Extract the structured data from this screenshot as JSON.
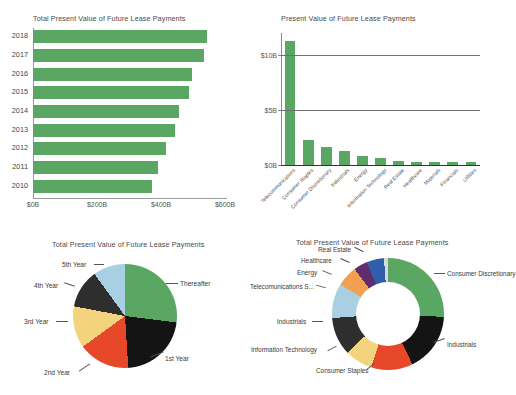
{
  "chart_data": [
    {
      "id": "total-pv-by-year",
      "type": "bar",
      "orientation": "horizontal",
      "title": "Total Present Value of Future Lease Payments",
      "xlabel": "",
      "ylabel": "",
      "categories": [
        "2018",
        "2017",
        "2016",
        "2015",
        "2014",
        "2013",
        "2012",
        "2011",
        "2010"
      ],
      "values": [
        545,
        535,
        497,
        487,
        455,
        445,
        415,
        390,
        372
      ],
      "unit": "$B",
      "xlim": [
        0,
        600
      ],
      "xticks": [
        "$0B",
        "$200B",
        "$400B",
        "$600B"
      ],
      "xtick_values": [
        0,
        200,
        400,
        600
      ],
      "grid": false,
      "series_color": "#5aa763"
    },
    {
      "id": "pv-by-sector",
      "type": "bar",
      "orientation": "vertical",
      "title": "Present Value of Future Lease Payments",
      "xlabel": "",
      "ylabel": "",
      "categories": [
        "Telecommunications",
        "Consumer Staples",
        "Consumer Discretionary",
        "Industrials",
        "Energy",
        "Information Technology",
        "Real Estate",
        "Healthcare",
        "Materials",
        "Financials",
        "Utilities"
      ],
      "values": [
        11.3,
        2.3,
        1.65,
        1.25,
        0.8,
        0.6,
        0.35,
        0.3,
        0.28,
        0.25,
        0.3
      ],
      "unit": "$B",
      "ylim": [
        0,
        12
      ],
      "yticks": [
        "$0B",
        "$5B",
        "$10B"
      ],
      "ytick_values": [
        0,
        5,
        10
      ],
      "grid": true,
      "series_color": "#5aa763"
    },
    {
      "id": "pv-by-maturity",
      "type": "pie",
      "title": "Total Present Value of Future Lease Payments",
      "labels": [
        "Thereafter",
        "1st Year",
        "2nd Year",
        "3rd Year",
        "4th Year",
        "5th Year"
      ],
      "values": [
        27,
        22,
        16,
        13,
        12,
        10
      ],
      "colors": [
        "#5aa763",
        "#141414",
        "#e8482a",
        "#f3d37e",
        "#2e2e2e",
        "#a9cfe3"
      ],
      "legend": "callout-labels"
    },
    {
      "id": "pv-by-sector-share",
      "type": "pie",
      "variant": "donut",
      "title": "Total Present Value of Future Lease Payments",
      "labels": [
        "Consumer Discretionary",
        "Industrials",
        "Consumer Staples",
        "Information Technology",
        "Industrials",
        "Telecomunications S...",
        "Energy",
        "Healthcare",
        "Real Estate"
      ],
      "values": [
        25,
        17,
        12,
        8,
        11,
        10,
        6,
        4,
        5
      ],
      "colors": [
        "#5aa763",
        "#141414",
        "#e8482a",
        "#f3d37e",
        "#2e2e2e",
        "#a9cfe3",
        "#f0a050",
        "#5f2d6e",
        "#2f5fab"
      ],
      "extra_slice_color": "#d8d8d8",
      "legend": "callout-labels"
    }
  ],
  "hbar": {
    "title": "Total Present Value of Future Lease Payments",
    "rows": [
      {
        "cat": "2018",
        "val": 545
      },
      {
        "cat": "2017",
        "val": 535
      },
      {
        "cat": "2016",
        "val": 497
      },
      {
        "cat": "2015",
        "val": 487
      },
      {
        "cat": "2014",
        "val": 455
      },
      {
        "cat": "2013",
        "val": 445
      },
      {
        "cat": "2012",
        "val": 415
      },
      {
        "cat": "2011",
        "val": 390
      },
      {
        "cat": "2010",
        "val": 372
      }
    ],
    "ticks": [
      "$0B",
      "$200B",
      "$400B",
      "$600B"
    ]
  },
  "vbar": {
    "title": "Present Value of Future Lease Payments",
    "bars": [
      {
        "cat": "Telecommunications",
        "val": 11.3
      },
      {
        "cat": "Consumer Staples",
        "val": 2.3
      },
      {
        "cat": "Consumer Discretionary",
        "val": 1.65
      },
      {
        "cat": "Industrials",
        "val": 1.25
      },
      {
        "cat": "Energy",
        "val": 0.8
      },
      {
        "cat": "Information Technology",
        "val": 0.6
      },
      {
        "cat": "Real Estate",
        "val": 0.35
      },
      {
        "cat": "Healthcare",
        "val": 0.3
      },
      {
        "cat": "Materials",
        "val": 0.28
      },
      {
        "cat": "Financials",
        "val": 0.25
      },
      {
        "cat": "Utilities",
        "val": 0.3
      }
    ],
    "ticks": [
      "$10B",
      "$5B",
      "$0B"
    ]
  },
  "pie": {
    "title": "Total Present Value of Future Lease Payments",
    "labels": {
      "thereafter": "Thereafter",
      "first": "1st Year",
      "second": "2nd Year",
      "third": "3rd Year",
      "fourth": "4th Year",
      "fifth": "5th Year"
    }
  },
  "donut": {
    "title": "Total Present Value of Future Lease Payments",
    "labels": {
      "consumer_discretionary": "Consumer Discretionary",
      "industrials_right": "Industrials",
      "consumer_staples": "Consumer Staples",
      "information_technology": "Information Technology",
      "industrials_left": "Industrials",
      "telecom": "Telecomunications S...",
      "energy": "Energy",
      "healthcare": "Healthcare",
      "real_estate": "Real Estate"
    }
  }
}
